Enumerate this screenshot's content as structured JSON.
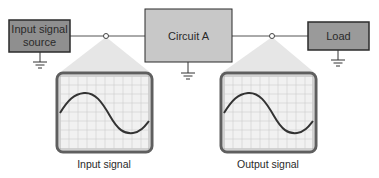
{
  "diagram": {
    "blocks": [
      {
        "id": "source",
        "label_line1": "Input signal",
        "label_line2": "source"
      },
      {
        "id": "circuit",
        "label": "Circuit A"
      },
      {
        "id": "load",
        "label": "Load"
      }
    ],
    "scopes": [
      {
        "id": "input",
        "label": "Input signal"
      },
      {
        "id": "output",
        "label": "Output signal"
      }
    ],
    "colors": {
      "source_fill": "#8f8f8f",
      "circuit_fill": "#c8c8c8",
      "load_fill": "#9a9a9a",
      "border": "#2b2b2b",
      "wire": "#555555",
      "beam": "#e3e3e3",
      "scope_frame": "#6a6a6a",
      "scope_screen": "#f2f2f2",
      "grid": "#c9c9c9",
      "trace": "#333333"
    }
  }
}
